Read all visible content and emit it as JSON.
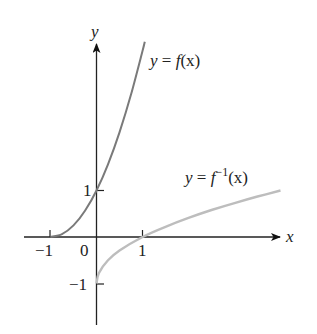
{
  "chart_data": {
    "type": "line",
    "title": "",
    "xlabel": "x",
    "ylabel": "y",
    "x_ticks": [
      "-1",
      "0",
      "1"
    ],
    "y_ticks": [
      "1",
      "-1"
    ],
    "xlim": [
      -1.5,
      4.1
    ],
    "ylim": [
      -1.9,
      4.2
    ],
    "grid": false,
    "series": [
      {
        "name": "y = f(x)",
        "color": "#7a7a7a",
        "x": [
          -1,
          -0.75,
          -0.5,
          -0.25,
          0,
          0.25,
          0.5,
          0.75,
          1.0,
          1.05
        ],
        "y": [
          0,
          0.0625,
          0.25,
          0.5625,
          1,
          1.5625,
          2.25,
          3.0625,
          4.0,
          4.2
        ]
      },
      {
        "name": "y = f^-1(x)",
        "color": "#bdbdbd",
        "x": [
          0,
          0.05,
          0.25,
          0.5,
          1,
          1.5,
          2,
          2.5,
          3,
          3.5,
          4.0
        ],
        "y": [
          -1,
          -0.78,
          -0.5,
          -0.29,
          0,
          0.22,
          0.41,
          0.58,
          0.73,
          0.87,
          1.0
        ]
      }
    ],
    "annotations": [
      {
        "text_prefix": "y = f(x)",
        "near": "f curve top"
      },
      {
        "text_prefix": "y = f^-1(x)",
        "near": "inverse curve right"
      }
    ]
  },
  "labels": {
    "axis_x": "x",
    "axis_y": "y",
    "tick_x_neg1": "−1",
    "tick_x_0": "0",
    "tick_x_1": "1",
    "tick_y_1": "1",
    "tick_y_neg1": "−1",
    "f_label_y": "y",
    "f_label_eq": " = ",
    "f_label_f": "f",
    "f_label_arg": "(x)",
    "inv_label_y": "y",
    "inv_label_eq": " = ",
    "inv_label_f": "f",
    "inv_label_sup": "−1",
    "inv_label_arg": "(x)"
  }
}
